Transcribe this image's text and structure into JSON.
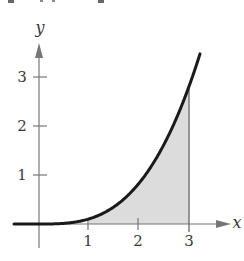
{
  "chart_data": {
    "type": "area",
    "title": "",
    "function_description": "f(x) ≈ x³/10 for x ≥ 0, 0 for x < 0",
    "xlabel": "x",
    "ylabel": "y",
    "x_ticks": [
      "1",
      "2",
      "3"
    ],
    "y_ticks": [
      "1",
      "2",
      "3"
    ],
    "xlim": [
      -0.5,
      4.0
    ],
    "ylim": [
      -0.5,
      3.6
    ],
    "grid": false,
    "curve": {
      "x": [
        -0.5,
        0,
        0.5,
        1,
        1.5,
        2,
        2.5,
        3,
        3.22
      ],
      "y": [
        0,
        0,
        0.0125,
        0.1,
        0.34,
        0.8,
        1.56,
        2.7,
        3.34
      ]
    },
    "shaded_region": {
      "from_x": 1,
      "to_x": 3,
      "under": "curve",
      "fill": "#dcdcdc"
    },
    "colors": {
      "curve": "#1a1a1a",
      "axes": "#777777",
      "shade": "#dcdcdc"
    }
  },
  "labels": {
    "x_axis": "x",
    "y_axis": "y",
    "tick_x1": "1",
    "tick_x2": "2",
    "tick_x3": "3",
    "tick_y1": "1",
    "tick_y2": "2",
    "tick_y3": "3"
  }
}
